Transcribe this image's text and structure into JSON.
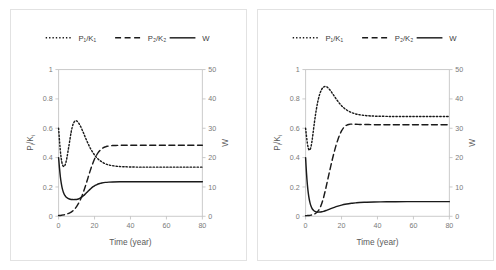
{
  "figure": {
    "panel_count": 2,
    "background_color": "#ffffff",
    "border_color": "#e2e2e2",
    "line_color": "#1a1a1a",
    "axis_color": "#bdbdbd"
  },
  "chart_data": [
    {
      "type": "line",
      "panel_id": "left-panel",
      "title": "",
      "xlabel": "Time (year)",
      "ylabel": "Pi/Ki",
      "y2label": "W",
      "xlim": [
        0,
        80
      ],
      "ylim": [
        0,
        1
      ],
      "y2lim": [
        0,
        50
      ],
      "xticks": [
        0,
        20,
        40,
        60,
        80
      ],
      "xtick_labels": [
        "0",
        "20",
        "40",
        "60",
        "80"
      ],
      "yticks": [
        0,
        0.2,
        0.4,
        0.6,
        0.8,
        1
      ],
      "ytick_labels": [
        "0",
        "0.2",
        "0.4",
        "0.6",
        "0.8",
        "1"
      ],
      "y2ticks": [
        0,
        10,
        20,
        30,
        40,
        50
      ],
      "y2tick_labels": [
        "0",
        "10",
        "20",
        "30",
        "40",
        "50"
      ],
      "grid": false,
      "legend_position": "top",
      "series": [
        {
          "name": "P1/K1",
          "label": "P₁/K₁",
          "style": "dotted",
          "axis": "left",
          "x": [
            0,
            0.6,
            1.2,
            1.8,
            2.4,
            3,
            3.6,
            4.4,
            5.2,
            6,
            7,
            8,
            9,
            10,
            11,
            12,
            13,
            14,
            15,
            16,
            17,
            18,
            19,
            20,
            21,
            22,
            23,
            24,
            26,
            28,
            30,
            33,
            36,
            40,
            45,
            50,
            60,
            70,
            80
          ],
          "values": [
            0.6,
            0.5,
            0.42,
            0.37,
            0.345,
            0.34,
            0.35,
            0.385,
            0.44,
            0.5,
            0.575,
            0.625,
            0.648,
            0.65,
            0.638,
            0.618,
            0.592,
            0.564,
            0.534,
            0.506,
            0.48,
            0.456,
            0.436,
            0.418,
            0.403,
            0.39,
            0.38,
            0.372,
            0.358,
            0.35,
            0.345,
            0.34,
            0.338,
            0.336,
            0.335,
            0.335,
            0.335,
            0.335,
            0.335
          ]
        },
        {
          "name": "P2/K2",
          "label": "P₂/K₂",
          "style": "dashed",
          "axis": "left",
          "x": [
            0,
            1,
            2,
            3,
            4,
            5,
            6,
            7,
            8,
            9,
            10,
            11,
            12,
            13,
            14,
            15,
            16,
            17,
            18,
            19,
            20,
            21,
            22,
            23,
            24,
            25,
            26,
            27,
            28,
            30,
            32,
            34,
            36,
            40,
            45,
            50,
            60,
            70,
            80
          ],
          "values": [
            0.005,
            0.006,
            0.008,
            0.01,
            0.013,
            0.017,
            0.022,
            0.029,
            0.038,
            0.05,
            0.066,
            0.086,
            0.11,
            0.139,
            0.172,
            0.209,
            0.248,
            0.288,
            0.326,
            0.36,
            0.39,
            0.414,
            0.434,
            0.449,
            0.46,
            0.468,
            0.473,
            0.477,
            0.479,
            0.482,
            0.483,
            0.484,
            0.484,
            0.484,
            0.484,
            0.484,
            0.484,
            0.484,
            0.484
          ]
        },
        {
          "name": "W",
          "label": "W",
          "style": "solid",
          "axis": "right",
          "x": [
            0,
            0.5,
            1,
            1.5,
            2,
            2.5,
            3,
            3.5,
            4,
            5,
            6,
            7,
            8,
            9,
            10,
            11,
            12,
            13,
            14,
            15,
            16,
            17,
            18,
            19,
            20,
            21,
            22,
            23,
            24,
            26,
            28,
            30,
            34,
            40,
            50,
            60,
            70,
            80
          ],
          "values": [
            20.0,
            16.4,
            13.4,
            11.2,
            9.6,
            8.5,
            7.7,
            7.1,
            6.7,
            6.2,
            5.9,
            5.75,
            5.7,
            5.7,
            5.75,
            5.9,
            6.2,
            6.6,
            7.1,
            7.7,
            8.3,
            8.9,
            9.5,
            10.0,
            10.4,
            10.7,
            11.0,
            11.2,
            11.35,
            11.55,
            11.65,
            11.7,
            11.75,
            11.78,
            11.8,
            11.8,
            11.8,
            11.8
          ]
        }
      ]
    },
    {
      "type": "line",
      "panel_id": "right-panel",
      "title": "",
      "xlabel": "Time (year)",
      "ylabel": "Pi/Ki",
      "y2label": "W",
      "xlim": [
        0,
        80
      ],
      "ylim": [
        0,
        1
      ],
      "y2lim": [
        0,
        50
      ],
      "xticks": [
        0,
        20,
        40,
        60,
        80
      ],
      "xtick_labels": [
        "0",
        "20",
        "40",
        "60",
        "80"
      ],
      "yticks": [
        0,
        0.2,
        0.4,
        0.6,
        0.8,
        1
      ],
      "ytick_labels": [
        "0",
        "0.2",
        "0.4",
        "0.6",
        "0.8",
        "1"
      ],
      "y2ticks": [
        0,
        10,
        20,
        30,
        40,
        50
      ],
      "y2tick_labels": [
        "0",
        "10",
        "20",
        "30",
        "40",
        "50"
      ],
      "grid": false,
      "legend_position": "top",
      "series": [
        {
          "name": "P1/K1",
          "label": "P₁/K₁",
          "style": "dotted",
          "axis": "left",
          "x": [
            0,
            0.5,
            1,
            1.5,
            2,
            2.5,
            3,
            3.5,
            4,
            5,
            6,
            7,
            8,
            9,
            10,
            11,
            12,
            13,
            14,
            15,
            16,
            17,
            18,
            19,
            20,
            21,
            22,
            24,
            26,
            28,
            30,
            33,
            36,
            40,
            45,
            50,
            60,
            70,
            80
          ],
          "values": [
            0.6,
            0.545,
            0.497,
            0.466,
            0.452,
            0.455,
            0.474,
            0.508,
            0.552,
            0.648,
            0.73,
            0.793,
            0.838,
            0.866,
            0.881,
            0.885,
            0.88,
            0.869,
            0.854,
            0.836,
            0.818,
            0.8,
            0.783,
            0.768,
            0.754,
            0.742,
            0.732,
            0.716,
            0.705,
            0.697,
            0.692,
            0.687,
            0.684,
            0.682,
            0.681,
            0.68,
            0.68,
            0.68,
            0.68
          ]
        },
        {
          "name": "P2/K2",
          "label": "P₂/K₂",
          "style": "dashed",
          "axis": "left",
          "x": [
            0,
            1,
            2,
            3,
            4,
            5,
            6,
            7,
            8,
            9,
            10,
            11,
            12,
            13,
            14,
            15,
            16,
            17,
            18,
            19,
            20,
            21,
            22,
            23,
            24,
            25,
            26,
            27,
            28,
            30,
            32,
            35,
            40,
            45,
            50,
            60,
            70,
            80
          ],
          "values": [
            0.004,
            0.005,
            0.006,
            0.008,
            0.011,
            0.016,
            0.024,
            0.037,
            0.057,
            0.087,
            0.128,
            0.178,
            0.232,
            0.288,
            0.342,
            0.394,
            0.442,
            0.486,
            0.524,
            0.556,
            0.582,
            0.601,
            0.614,
            0.622,
            0.626,
            0.628,
            0.628,
            0.627,
            0.627,
            0.626,
            0.625,
            0.625,
            0.624,
            0.624,
            0.624,
            0.624,
            0.624,
            0.624
          ]
        },
        {
          "name": "W",
          "label": "W",
          "style": "solid",
          "axis": "right",
          "x": [
            0,
            0.5,
            1,
            1.5,
            2,
            2.5,
            3,
            3.5,
            4,
            4.5,
            5,
            5.5,
            6,
            7,
            8,
            9,
            10,
            11,
            12,
            13,
            14,
            16,
            18,
            20,
            22,
            24,
            26,
            28,
            30,
            34,
            38,
            45,
            50,
            60,
            70,
            80
          ],
          "values": [
            20.0,
            14.7,
            10.7,
            7.9,
            5.9,
            4.5,
            3.5,
            2.8,
            2.3,
            2.0,
            1.75,
            1.6,
            1.5,
            1.42,
            1.45,
            1.55,
            1.7,
            1.9,
            2.1,
            2.35,
            2.6,
            3.05,
            3.45,
            3.8,
            4.1,
            4.3,
            4.45,
            4.58,
            4.68,
            4.8,
            4.88,
            4.95,
            4.97,
            5.0,
            5.0,
            5.0
          ]
        }
      ]
    }
  ]
}
